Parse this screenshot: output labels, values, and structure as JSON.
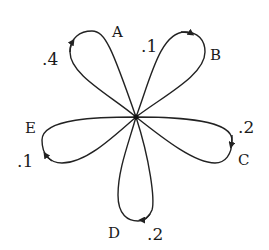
{
  "diagram": {
    "type": "self-loop flower (state diagram)",
    "center": {
      "x": 136,
      "y": 117
    },
    "stroke_color": "#222222",
    "loops": [
      {
        "state": "A",
        "probability": ".4",
        "label_pos": [
          112,
          37
        ],
        "prob_pos": [
          42,
          65
        ],
        "arrow": "up"
      },
      {
        "state": "B",
        "probability": ".1",
        "label_pos": [
          210,
          60
        ],
        "prob_pos": [
          141,
          52
        ],
        "arrow": "right"
      },
      {
        "state": "C",
        "probability": ".2",
        "label_pos": [
          238,
          165
        ],
        "prob_pos": [
          238,
          133
        ],
        "arrow": "down"
      },
      {
        "state": "D",
        "probability": ".2",
        "label_pos": [
          108,
          238
        ],
        "prob_pos": [
          147,
          240
        ],
        "arrow": "left"
      },
      {
        "state": "E",
        "probability": ".1",
        "label_pos": [
          25,
          133
        ],
        "prob_pos": [
          17,
          167
        ],
        "arrow": "up-left"
      }
    ]
  }
}
